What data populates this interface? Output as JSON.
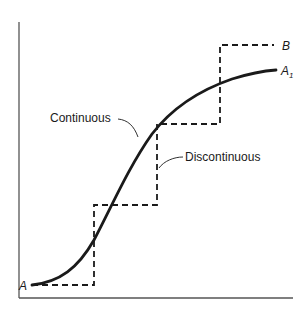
{
  "diagram": {
    "labels": {
      "start": "A",
      "end_continuous": "A",
      "end_continuous_sub": "1",
      "end_discontinuous": "B",
      "continuous": "Continuous",
      "discontinuous": "Discontinuous"
    },
    "colors": {
      "ink": "#1a1a1a",
      "axis": "#555555",
      "background": "#ffffff"
    }
  }
}
